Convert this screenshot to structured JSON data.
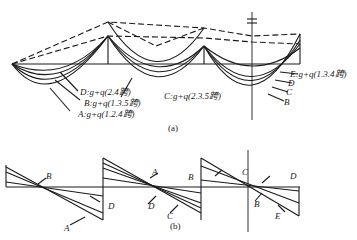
{
  "figure": {
    "part_a": {
      "caption": "(a)",
      "labels": {
        "D": "D:g+q(2.4跨)",
        "B": "B:g+q(1.3.5跨)",
        "A": "A:g+q(1.2.4跨)",
        "C": "C:g+q(2.3.5跨)",
        "E": "E:g+q(1.3.4跨)",
        "right_D": "D",
        "right_C": "C",
        "right_B": "B"
      }
    },
    "part_b": {
      "caption": "(b)",
      "labels": {
        "B1": "B",
        "D1": "D",
        "A1": "A",
        "A2": "A",
        "D2": "D",
        "C2": "C",
        "B2": "B",
        "C3": "C",
        "D3": "D",
        "B3": "B",
        "E3": "E"
      }
    },
    "colors": {
      "line": "#1a1a1a",
      "background": "#ffffff"
    }
  }
}
